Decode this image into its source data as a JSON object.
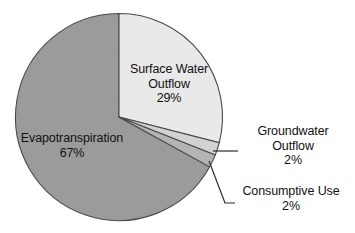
{
  "chart_data": {
    "type": "pie",
    "title": "",
    "subtitle": "",
    "xlabel": "",
    "ylabel": "",
    "legend_position": "none",
    "grid": false,
    "unit": "%",
    "categories": [
      "Surface Water Outflow",
      "Groundwater Outflow",
      "Consumptive Use",
      "Evapotranspiration"
    ],
    "values": [
      29,
      2,
      2,
      67
    ],
    "slices": [
      {
        "name": "Surface Water Outflow",
        "label_line_1": "Surface Water",
        "label_line_2": "Outflow",
        "value": 29,
        "value_label": "29%",
        "color": "#e9e9e9",
        "label_placement": "inside"
      },
      {
        "name": "Groundwater Outflow",
        "label_line_1": "Groundwater",
        "label_line_2": "Outflow",
        "value": 2,
        "value_label": "2%",
        "color": "#d2d2d2",
        "label_placement": "outside-leader"
      },
      {
        "name": "Consumptive Use",
        "label_line_1": "Consumptive Use",
        "label_line_2": "",
        "value": 2,
        "value_label": "2%",
        "color": "#b4b4b4",
        "label_placement": "outside-leader"
      },
      {
        "name": "Evapotranspiration",
        "label_line_1": "Evapotranspiration",
        "label_line_2": "",
        "value": 67,
        "value_label": "67%",
        "color": "#9b9b9b",
        "label_placement": "inside"
      }
    ],
    "start_angle_deg": 0,
    "direction": "clockwise",
    "stroke_color": "#4a4a4a",
    "background": "#ffffff"
  }
}
